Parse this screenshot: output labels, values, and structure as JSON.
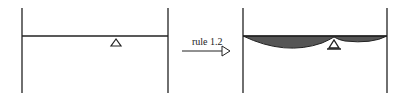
{
  "diagram": {
    "type": "beam-moment-transformation",
    "left_panel": {
      "description": "simply supported beam with center support, no moment"
    },
    "arrow": {
      "label": "rule 1.2"
    },
    "right_panel": {
      "description": "beam with shaded moment diagram (sagging spans) and center support"
    },
    "colors": {
      "line": "#222222",
      "fill": "#555555",
      "background": "#ffffff"
    }
  }
}
